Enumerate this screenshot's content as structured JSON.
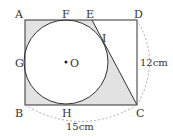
{
  "diagram": {
    "type": "geometry",
    "points": {
      "A": "A",
      "B": "B",
      "C": "C",
      "D": "D",
      "E": "E",
      "F": "F",
      "G": "G",
      "H": "H",
      "I": "I",
      "O": "O"
    },
    "dimensions": {
      "height_label": "12cm",
      "width_label": "15cm"
    },
    "colors": {
      "shade": "#e2e2e2",
      "stroke": "#333333",
      "dashed": "#999999"
    }
  }
}
